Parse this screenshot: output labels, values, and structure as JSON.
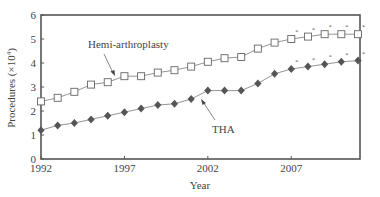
{
  "chart_data": {
    "type": "line",
    "title": "",
    "xlabel": "Year",
    "ylabel": "Procedures (×10⁴)",
    "ylabel_main": "Procedures (×10",
    "ylabel_sup": "4",
    "ylabel_tail": ")",
    "xlim": [
      1992,
      2011
    ],
    "ylim": [
      0,
      6
    ],
    "grid": false,
    "legend": "none (inline annotations with arrows)",
    "x_ticks": [
      1992,
      1997,
      2002,
      2007
    ],
    "y_ticks": [
      0,
      1,
      2,
      3,
      4,
      5,
      6
    ],
    "x": [
      1992,
      1993,
      1994,
      1995,
      1996,
      1997,
      1998,
      1999,
      2000,
      2001,
      2002,
      2003,
      2004,
      2005,
      2006,
      2007,
      2008,
      2009,
      2010,
      2011
    ],
    "series": [
      {
        "name": "Hemi-arthroplasty",
        "marker": "open-square",
        "color": "#777777",
        "values": [
          2.4,
          2.55,
          2.8,
          3.1,
          3.2,
          3.45,
          3.45,
          3.6,
          3.7,
          3.85,
          4.05,
          4.2,
          4.25,
          4.6,
          4.85,
          5.0,
          5.1,
          5.2,
          5.2,
          5.2
        ],
        "asterisk_years": [
          2007,
          2008,
          2009,
          2010,
          2011
        ]
      },
      {
        "name": "THA",
        "marker": "filled-diamond",
        "color": "#555555",
        "values": [
          1.2,
          1.4,
          1.5,
          1.65,
          1.8,
          1.95,
          2.1,
          2.25,
          2.3,
          2.5,
          2.85,
          2.85,
          2.85,
          3.15,
          3.55,
          3.75,
          3.85,
          3.95,
          4.05,
          4.1
        ],
        "asterisk_years": [
          2007,
          2008,
          2009,
          2010,
          2011
        ]
      }
    ],
    "annotations": [
      {
        "text": "Hemi-arthroplasty",
        "points_to": "Hemi-arthroplasty series near 1997"
      },
      {
        "text": "THA",
        "points_to": "THA series near 2002"
      }
    ],
    "asterisk_symbol": "*"
  }
}
